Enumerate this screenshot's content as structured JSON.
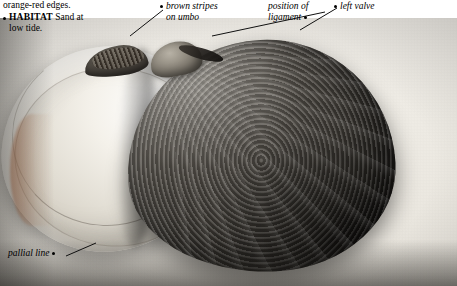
{
  "page": {
    "width": 457,
    "height": 286,
    "background": "#ffffff"
  },
  "caption": {
    "line1": "orange-red edges.",
    "habitat_label": "HABITAT",
    "habitat_text": "Sand at",
    "habitat_text2": "low tide."
  },
  "labels": [
    {
      "id": "brown-stripes",
      "line1": "brown stripes",
      "line2": "on umbo"
    },
    {
      "id": "position-of-ligament",
      "line1": "position of",
      "line2": "ligament"
    },
    {
      "id": "left-valve",
      "line1": "left valve",
      "line2": ""
    },
    {
      "id": "pallial-line",
      "line1": "pallial line",
      "line2": ""
    }
  ],
  "specimen": {
    "name": "bivalve-shell",
    "valve_right": "right-valve-exterior",
    "valve_left": "left-valve-interior"
  },
  "colors": {
    "text": "#000000",
    "plate_light": "#f2efe9",
    "plate_dark": "#26231f",
    "orange_red_edge": "#ae6034"
  }
}
